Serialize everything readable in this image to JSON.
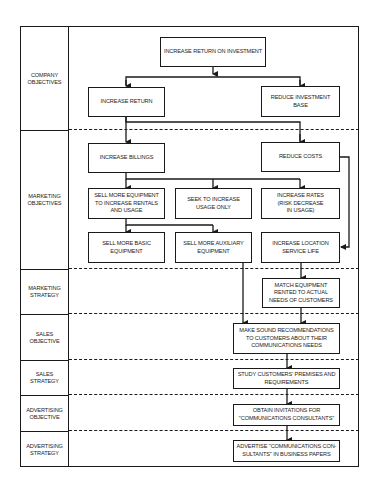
{
  "rows": [
    {
      "id": "company-objectives",
      "label": "COMPANY\nOBJECTIVES"
    },
    {
      "id": "marketing-objectives",
      "label": "MARKETING\nOBJECTIVES"
    },
    {
      "id": "marketing-strategy",
      "label": "MARKETING\nSTRATEGY"
    },
    {
      "id": "sales-objective",
      "label": "SALES\nOBJECTIVE"
    },
    {
      "id": "sales-strategy",
      "label": "SALES\nSTRATEGY"
    },
    {
      "id": "advertising-objective",
      "label": "ADVERTISING\nOBJECTIVE"
    },
    {
      "id": "advertising-strategy",
      "label": "ADVERTISING\nSTRATEGY"
    }
  ],
  "nodes": {
    "increase_roi": "INCREASE RETURN ON INVESTMENT",
    "increase_return": "INCREASE RETURN",
    "reduce_investment_base": "REDUCE INVESTMENT BASE",
    "increase_billings": "INCREASE BILLINGS",
    "reduce_costs": "REDUCE COSTS",
    "sell_more_equipment": "SELL MORE EQUIPMENT\nTO INCREASE RENTALS\nAND USAGE",
    "seek_increase_usage": "SEEK TO INCREASE\nUSAGE ONLY",
    "increase_rates": "INCREASE RATES\n(RISK DECREASE\nIN USAGE)",
    "sell_basic": "SELL MORE BASIC\nEQUIPMENT",
    "sell_auxiliary": "SELL MORE AUXILIARY\nEQUIPMENT",
    "increase_location_life": "INCREASE LOCATION\nSERVICE LIFE",
    "match_equipment": "MATCH EQUIPMENT\nRENTED TO ACTUAL\nNEEDS OF CUSTOMERS",
    "sound_recommendations": "MAKE SOUND RECOMMENDATIONS\nTO CUSTOMERS ABOUT THEIR\nCOMMUNICATIONS NEEDS",
    "study_premises": "STUDY CUSTOMERS' PREMISES AND\nREQUIREMENTS",
    "obtain_invitations": "OBTAIN INVITATIONS FOR\n\"COMMUNICATIONS CONSULTANTS\"",
    "advertise": "ADVERTISE \"COMMUNICATIONS CON-\nSULTANTS\" IN BUSINESS PAPERS"
  },
  "edges": [
    [
      "increase_roi",
      "increase_return"
    ],
    [
      "increase_roi",
      "reduce_investment_base"
    ],
    [
      "increase_return",
      "increase_billings"
    ],
    [
      "increase_return",
      "reduce_costs"
    ],
    [
      "increase_billings",
      "sell_more_equipment"
    ],
    [
      "increase_billings",
      "seek_increase_usage"
    ],
    [
      "increase_billings",
      "increase_rates"
    ],
    [
      "sell_more_equipment",
      "sell_basic"
    ],
    [
      "sell_more_equipment",
      "sell_auxiliary"
    ],
    [
      "reduce_costs",
      "increase_location_life"
    ],
    [
      "sell_auxiliary",
      "sound_recommendations"
    ],
    [
      "increase_location_life",
      "match_equipment"
    ],
    [
      "match_equipment",
      "sound_recommendations"
    ],
    [
      "sound_recommendations",
      "study_premises"
    ],
    [
      "study_premises",
      "obtain_invitations"
    ],
    [
      "obtain_invitations",
      "advertise"
    ]
  ],
  "colors": {
    "ink": "#1a1a1a",
    "background": "#ffffff"
  }
}
